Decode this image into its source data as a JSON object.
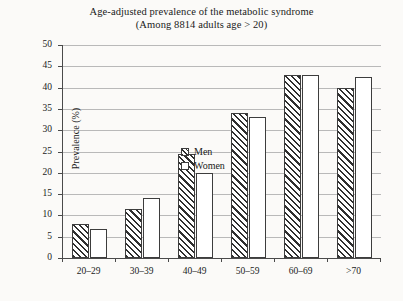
{
  "chart_data": {
    "type": "bar",
    "title": "Age-adjusted prevalence of the metabolic syndrome",
    "subtitle": "(Among 8814 adults age > 20)",
    "xlabel": "",
    "ylabel": "Prevalence (%)",
    "ylim": [
      0,
      50
    ],
    "ytick_step": 5,
    "yticks": [
      0,
      5,
      10,
      15,
      20,
      25,
      30,
      35,
      40,
      45,
      50
    ],
    "grid": true,
    "legend_position": "inside-upper-left",
    "categories": [
      "20–29",
      "30–39",
      "40–49",
      "50–59",
      "60–69",
      ">70"
    ],
    "series": [
      {
        "name": "Men",
        "values": [
          8.0,
          11.5,
          24.3,
          34.0,
          43.0,
          40.0
        ],
        "fill": "diagonal-hatch"
      },
      {
        "name": "Women",
        "values": [
          6.7,
          14.0,
          20.0,
          33.0,
          43.0,
          42.5
        ],
        "fill": "white"
      }
    ]
  },
  "colors": {
    "background": "#fbfaf8",
    "axis": "#4a4a4a",
    "gridline": "#b9b9b9",
    "bar_outline": "#3d3d3d",
    "hatch": "#2f2f2f",
    "text": "#1a1a1a"
  }
}
